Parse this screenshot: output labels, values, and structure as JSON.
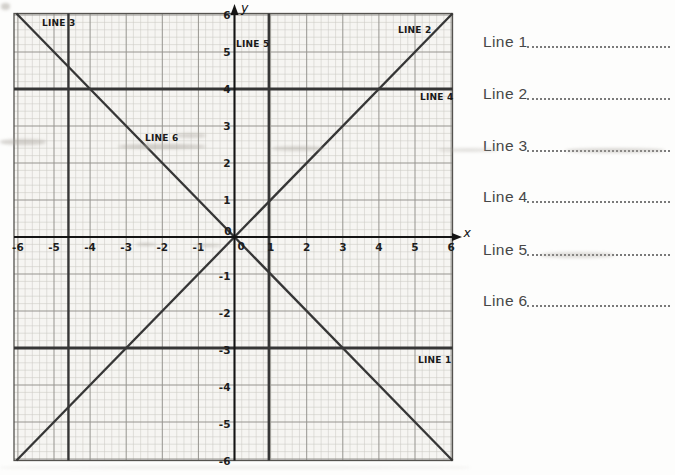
{
  "chart_data": {
    "type": "line",
    "title": "",
    "xlabel": "x",
    "ylabel": "y",
    "xlim": [
      -6,
      6
    ],
    "ylim": [
      -6,
      6
    ],
    "grid": true,
    "x_ticks": [
      -6,
      -5,
      -4,
      -3,
      -2,
      -1,
      1,
      2,
      3,
      4,
      5,
      6
    ],
    "y_ticks": [
      6,
      5,
      4,
      3,
      2,
      1,
      -1,
      -2,
      -3,
      -4,
      -5,
      -6
    ],
    "origin_label_left": "0",
    "origin_label_right": "0",
    "plotted_lines": [
      {
        "id": "diagonal-positive-slope",
        "kind": "diagonal",
        "slope": 1,
        "intercept": 0
      },
      {
        "id": "diagonal-negative-slope",
        "kind": "diagonal",
        "slope": -1,
        "intercept": 0
      },
      {
        "id": "horizontal-upper",
        "kind": "horizontal",
        "y": 4
      },
      {
        "id": "horizontal-lower",
        "kind": "horizontal",
        "y": -3
      },
      {
        "id": "vertical-right",
        "kind": "vertical",
        "x": 0.95
      },
      {
        "id": "vertical-left",
        "kind": "vertical",
        "x": -4.6
      }
    ],
    "line_labels": [
      {
        "text": "LINE 1",
        "px": 418,
        "py": 363
      },
      {
        "text": "LINE 2",
        "px": 398,
        "py": 33
      },
      {
        "text": "LINE 3",
        "px": 42,
        "py": 26
      },
      {
        "text": "LINE 4",
        "px": 420,
        "py": 100
      },
      {
        "text": "LINE 5",
        "px": 236,
        "py": 47
      },
      {
        "text": "LINE 6",
        "px": 145,
        "py": 141
      }
    ]
  },
  "answers": {
    "rows": [
      {
        "label": "Line 1",
        "value": ""
      },
      {
        "label": "Line 2",
        "value": ""
      },
      {
        "label": "Line 3",
        "value": ""
      },
      {
        "label": "Line 4",
        "value": ""
      },
      {
        "label": "Line 5",
        "value": ""
      },
      {
        "label": "Line 6",
        "value": ""
      }
    ]
  },
  "colors": {
    "paper": "#f6f5f2",
    "minor_grid": "#cbc9c5",
    "major_grid": "#96948f",
    "axis": "#141414",
    "plotted_line": "#363636",
    "label_text": "#191919",
    "answer_text": "#474747"
  }
}
